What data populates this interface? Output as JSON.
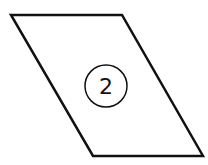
{
  "diagram": {
    "shape": "parallelogram",
    "label": "2",
    "stroke_color": "#111111",
    "background": "#ffffff"
  }
}
